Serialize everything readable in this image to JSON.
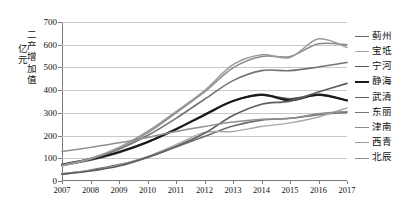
{
  "chart_data": {
    "type": "line",
    "title": "",
    "xlabel": "",
    "ylabel": "二产增加值 亿元",
    "ylabel_line1": "二产增加值",
    "ylabel_line2": "亿元",
    "ylim": [
      0,
      700
    ],
    "ytick_step": 100,
    "yticks": [
      "0",
      "100",
      "200",
      "300",
      "400",
      "500",
      "600",
      "700"
    ],
    "grid": true,
    "legend_position": "right",
    "categories": [
      "2007",
      "2008",
      "2009",
      "2010",
      "2011",
      "2012",
      "2013",
      "2014",
      "2015",
      "2016",
      "2017"
    ],
    "x": [
      2007,
      2008,
      2009,
      2010,
      2011,
      2012,
      2013,
      2014,
      2015,
      2016,
      2017
    ],
    "series": [
      {
        "name": "蓟州",
        "color": "#6e6e6e",
        "width": 1.6,
        "values": [
          30,
          48,
          72,
          105,
          150,
          196,
          242,
          268,
          276,
          292,
          302
        ]
      },
      {
        "name": "宝坻",
        "color": "#a8a8a8",
        "width": 1.4,
        "values": [
          32,
          46,
          70,
          108,
          160,
          214,
          218,
          240,
          256,
          282,
          322
        ]
      },
      {
        "name": "宁河",
        "color": "#5a5a5a",
        "width": 1.7,
        "values": [
          70,
          92,
          125,
          170,
          228,
          290,
          352,
          378,
          362,
          378,
          355
        ]
      },
      {
        "name": "静海",
        "color": "#1a1a1a",
        "width": 2.2,
        "values": [
          72,
          96,
          128,
          172,
          228,
          292,
          352,
          380,
          355,
          380,
          355
        ]
      },
      {
        "name": "武清",
        "color": "#5e5e5e",
        "width": 1.7,
        "values": [
          30,
          44,
          66,
          104,
          152,
          210,
          288,
          338,
          352,
          392,
          430
        ]
      },
      {
        "name": "东丽",
        "color": "#737373",
        "width": 1.6,
        "values": [
          68,
          96,
          140,
          200,
          276,
          360,
          442,
          486,
          486,
          502,
          522
        ]
      },
      {
        "name": "津南",
        "color": "#8a8a8a",
        "width": 1.5,
        "values": [
          70,
          100,
          146,
          212,
          300,
          392,
          498,
          548,
          548,
          604,
          600
        ]
      },
      {
        "name": "西青",
        "color": "#9a9a9a",
        "width": 1.5,
        "values": [
          66,
          98,
          148,
          218,
          306,
          398,
          512,
          556,
          544,
          626,
          588
        ]
      },
      {
        "name": "北辰",
        "color": "#8f8f8f",
        "width": 1.5,
        "values": [
          130,
          148,
          168,
          192,
          218,
          240,
          260,
          272,
          276,
          296,
          306
        ]
      }
    ]
  },
  "legend": {
    "items": [
      {
        "label": "蓟州"
      },
      {
        "label": "宝坻"
      },
      {
        "label": "宁河"
      },
      {
        "label": "静海"
      },
      {
        "label": "武清"
      },
      {
        "label": "东丽"
      },
      {
        "label": "津南"
      },
      {
        "label": "西青"
      },
      {
        "label": "北辰"
      }
    ]
  }
}
